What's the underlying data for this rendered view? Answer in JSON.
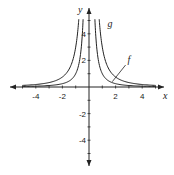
{
  "chart_data": {
    "type": "line",
    "title": "",
    "xlabel": "x",
    "ylabel": "y",
    "xlim": [
      -5.5,
      5.5
    ],
    "ylim": [
      -6,
      6
    ],
    "grid": false,
    "x_ticks": [
      -4,
      -2,
      2,
      4
    ],
    "y_ticks": [
      4,
      2,
      -2,
      -4
    ],
    "x_tick_labels": [
      "-4",
      "-2",
      "2",
      "4"
    ],
    "y_tick_labels": [
      "4",
      "2",
      "-2",
      "-4"
    ],
    "series": [
      {
        "name": "f",
        "formula": "1/x^2",
        "k": 1
      },
      {
        "name": "g",
        "formula": "3/x^2",
        "k": 3
      }
    ],
    "annotations": [
      {
        "text": "f",
        "x": 2.9,
        "y": 1.8,
        "points_to": [
          1.75,
          0.4
        ]
      },
      {
        "text": "g",
        "x": 1.4,
        "y": 4.5
      }
    ]
  }
}
